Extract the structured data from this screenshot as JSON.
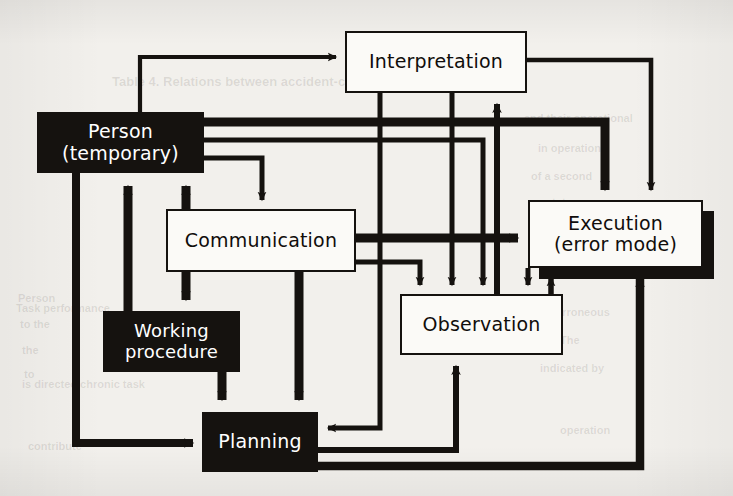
{
  "figure": {
    "kind": "flow-diagram",
    "caption_visible": false,
    "background_color": "#f2f0ec",
    "ink_color": "#15120f",
    "paper_color": "#fbfaf7",
    "canvas": {
      "width": 733,
      "height": 496
    }
  },
  "nodes": [
    {
      "id": "person",
      "label": "Person\n(temporary)",
      "style": "dark",
      "text_color": "#ffffff",
      "fill": "#15120f",
      "x": 37,
      "y": 112,
      "w": 167,
      "h": 61,
      "font_size": 19,
      "shadow": false
    },
    {
      "id": "interpretation",
      "label": "Interpretation",
      "style": "light",
      "text_color": "#100d0b",
      "fill": "#fbfaf7",
      "x": 345,
      "y": 31,
      "w": 182,
      "h": 62,
      "font_size": 19,
      "shadow": false
    },
    {
      "id": "communication",
      "label": "Communication",
      "style": "light",
      "text_color": "#100d0b",
      "fill": "#fbfaf7",
      "x": 166,
      "y": 209,
      "w": 190,
      "h": 63,
      "font_size": 19,
      "shadow": false
    },
    {
      "id": "execution",
      "label": "Execution\n(error mode)",
      "style": "light",
      "text_color": "#100d0b",
      "fill": "#fbfaf7",
      "x": 528,
      "y": 200,
      "w": 175,
      "h": 68,
      "font_size": 19,
      "shadow": true
    },
    {
      "id": "observation",
      "label": "Observation",
      "style": "light",
      "text_color": "#100d0b",
      "fill": "#fbfaf7",
      "x": 400,
      "y": 294,
      "w": 163,
      "h": 61,
      "font_size": 19,
      "shadow": false
    },
    {
      "id": "working-procedure",
      "label": "Working\nprocedure",
      "style": "dark",
      "text_color": "#ffffff",
      "fill": "#15120f",
      "x": 103,
      "y": 311,
      "w": 137,
      "h": 61,
      "font_size": 18,
      "shadow": false
    },
    {
      "id": "planning",
      "label": "Planning",
      "style": "dark",
      "text_color": "#ffffff",
      "fill": "#15120f",
      "x": 202,
      "y": 412,
      "w": 116,
      "h": 60,
      "font_size": 19,
      "shadow": false
    }
  ],
  "edges": [
    {
      "id": "person-to-interpretation",
      "from": "person",
      "to": "interpretation",
      "weight": "thin",
      "arrow": "single"
    },
    {
      "id": "person-to-execution",
      "from": "person",
      "to": "execution",
      "weight": "thick",
      "arrow": "single"
    },
    {
      "id": "person-to-observation",
      "from": "person",
      "to": "observation",
      "weight": "thin",
      "arrow": "single"
    },
    {
      "id": "person-to-communication",
      "from": "person",
      "to": "communication",
      "weight": "thin",
      "arrow": "single"
    },
    {
      "id": "person-to-planning",
      "from": "person",
      "to": "planning",
      "weight": "thick",
      "arrow": "single"
    },
    {
      "id": "communication-to-person",
      "from": "communication",
      "to": "person",
      "weight": "thick",
      "arrow": "single"
    },
    {
      "id": "communication-to-execution",
      "from": "communication",
      "to": "execution",
      "weight": "thick",
      "arrow": "single"
    },
    {
      "id": "communication-to-observation",
      "from": "communication",
      "to": "observation",
      "weight": "thin",
      "arrow": "single"
    },
    {
      "id": "communication-to-workingprocedure",
      "from": "communication",
      "to": "working-procedure",
      "weight": "thick",
      "arrow": "single"
    },
    {
      "id": "communication-to-planning",
      "from": "communication",
      "to": "planning",
      "weight": "thick",
      "arrow": "single"
    },
    {
      "id": "workingprocedure-to-person",
      "from": "working-procedure",
      "to": "person",
      "weight": "thick",
      "arrow": "single"
    },
    {
      "id": "workingprocedure-to-planning",
      "from": "working-procedure",
      "to": "planning",
      "weight": "thick",
      "arrow": "single"
    },
    {
      "id": "interpretation-to-execution",
      "from": "interpretation",
      "to": "execution",
      "weight": "thin",
      "arrow": "single"
    },
    {
      "id": "interpretation-to-observation",
      "from": "interpretation",
      "to": "observation",
      "weight": "thin",
      "arrow": "single"
    },
    {
      "id": "interpretation-to-planning",
      "from": "interpretation",
      "to": "planning",
      "weight": "thin",
      "arrow": "single"
    },
    {
      "id": "observation-to-interpretation",
      "from": "observation",
      "to": "interpretation",
      "weight": "thick",
      "arrow": "single"
    },
    {
      "id": "observation-to-execution",
      "from": "observation",
      "to": "execution",
      "weight": "thin",
      "arrow": "single"
    },
    {
      "id": "execution-to-observation",
      "from": "execution",
      "to": "observation",
      "weight": "thin",
      "arrow": "single"
    },
    {
      "id": "planning-to-observation",
      "from": "planning",
      "to": "observation",
      "weight": "thick",
      "arrow": "single"
    },
    {
      "id": "planning-to-execution",
      "from": "planning",
      "to": "execution",
      "weight": "thick",
      "arrow": "single"
    }
  ],
  "background_ghost_text": [
    {
      "text": "Table 4. Relations between accident-causing factors",
      "x": 112,
      "y": 74,
      "size": 13
    },
    {
      "text": "and their operational",
      "x": 524,
      "y": 112,
      "size": 11
    },
    {
      "text": "in operation",
      "x": 538,
      "y": 142,
      "size": 11
    },
    {
      "text": "of a second",
      "x": 531,
      "y": 170,
      "size": 11
    },
    {
      "text": "status",
      "x": 546,
      "y": 196,
      "size": 11
    },
    {
      "text": "Person",
      "x": 18,
      "y": 292,
      "size": 11
    },
    {
      "text": "to the",
      "x": 20,
      "y": 318,
      "size": 11
    },
    {
      "text": "the",
      "x": 22,
      "y": 344,
      "size": 11
    },
    {
      "text": "to",
      "x": 24,
      "y": 368,
      "size": 11
    },
    {
      "text": "Task performance",
      "x": 16,
      "y": 302,
      "size": 11
    },
    {
      "text": "erroneous",
      "x": 556,
      "y": 306,
      "size": 11
    },
    {
      "text": "The",
      "x": 560,
      "y": 334,
      "size": 11
    },
    {
      "text": "indicated by",
      "x": 540,
      "y": 362,
      "size": 11
    },
    {
      "text": "is directed chronic task",
      "x": 22,
      "y": 378,
      "size": 11
    },
    {
      "text": "contribute",
      "x": 28,
      "y": 440,
      "size": 11
    },
    {
      "text": "operation",
      "x": 560,
      "y": 424,
      "size": 11
    }
  ]
}
